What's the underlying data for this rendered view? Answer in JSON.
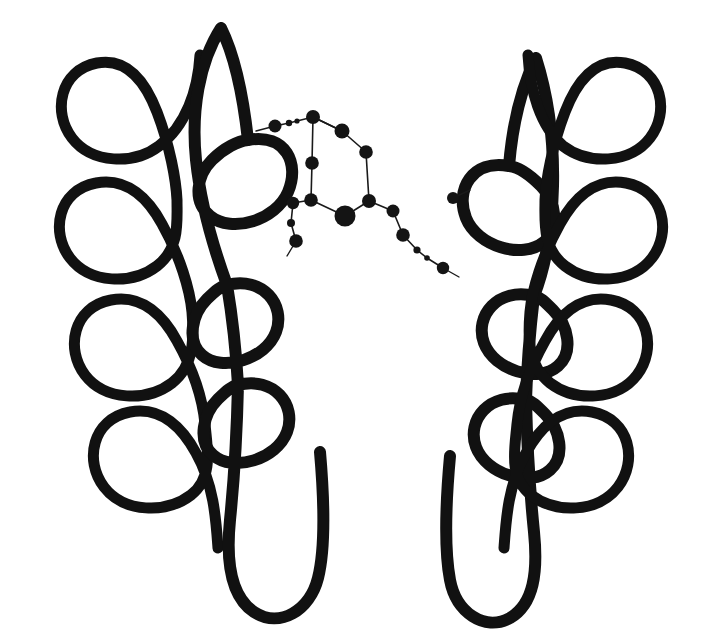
{
  "figure": {
    "kind": "protein-structure-cartoon",
    "background_color": "#ffffff",
    "ink_color": "#111111",
    "atom_color": "#141414",
    "bond_color": "#1a1a1a",
    "width": 720,
    "height": 634
  },
  "helices": [
    {
      "id": "helix-1",
      "label": "left-outer-helix",
      "coil_side": "left",
      "turns": 4,
      "stroke_width": 11,
      "tip": "tapered-top",
      "path": "M 97 63 C 60 70 52 112 72 138 C 92 164 134 165 159 146 C 186 126 198 90 200 55 M 97 63 C 129 57 147 86 157 112 C 170 146 176 180 177 200 M 96 183 C 58 190 50 232 70 258 C 90 284 132 285 157 266 C 180 248 177 222 177 200 M 96 183 C 128 177 149 200 162 224 C 180 256 190 290 192 312 M 111 300 C 73 307 65 349 85 375 C 105 401 147 402 172 383 C 195 365 194 336 192 312 M 111 300 C 143 294 164 317 177 341 C 195 373 203 403 205 424 M 130 412 C 92 419 84 461 104 487 C 124 513 166 514 191 495 C 214 477 207 448 205 424 M 130 412 C 162 406 183 429 196 453 C 214 485 216 520 218 548"
    },
    {
      "id": "helix-2",
      "label": "left-inner-helix",
      "coil_side": "right",
      "turns": 3,
      "stroke_width": 12,
      "tip": "tapered-top",
      "path": "M 221 28 C 199 62 191 112 196 160 C 201 208 215 252 227 285 M 221 28 C 236 58 244 104 248 140 M 248 140 C 286 133 300 164 288 192 C 276 220 232 234 210 216 C 192 201 197 175 212 160 C 224 148 238 141 248 140 M 227 285 C 263 276 286 305 276 332 C 266 359 222 373 202 355 C 186 341 192 314 207 299 C 216 290 221 286 227 285 M 227 285 C 232 315 236 350 238 385 M 238 385 C 274 376 297 405 287 432 C 277 459 233 473 213 455 C 197 441 203 414 218 399 C 227 390 232 386 238 385 M 238 385 C 237 430 234 480 230 520 C 226 560 230 596 254 612 C 280 629 310 610 318 578 C 326 546 324 498 320 452"
    },
    {
      "id": "helix-3",
      "label": "right-inner-helix",
      "coil_side": "left",
      "turns": 3,
      "stroke_width": 12,
      "tip": "arrow-top",
      "path": "M 536 58 C 548 96 554 142 553 186 C 552 230 545 268 534 296 M 536 58 C 520 90 512 130 509 166 M 509 166 C 472 159 455 190 466 218 C 477 246 522 260 544 242 C 560 228 556 201 541 186 C 529 174 519 167 509 166 M 534 296 C 498 287 474 316 484 343 C 494 370 538 384 558 366 C 574 352 568 325 553 310 C 544 301 540 297 534 296 M 534 296 C 530 330 527 365 526 400 M 526 400 C 490 391 466 420 476 447 C 486 474 530 488 550 470 C 566 456 560 429 545 414 C 536 405 532 401 526 400 M 526 400 C 527 445 530 492 534 532 C 538 572 534 604 510 618 C 484 632 456 612 450 580 C 444 548 446 500 450 456"
    },
    {
      "id": "helix-4",
      "label": "right-outer-helix",
      "coil_side": "right",
      "turns": 4,
      "stroke_width": 11,
      "tip": "tapered-top",
      "path": "M 625 63 C 662 70 670 112 650 138 C 630 164 588 165 563 146 C 540 126 530 90 528 55 M 625 63 C 593 57 575 86 565 112 C 552 146 546 180 545 200 M 626 183 C 664 190 672 232 652 258 C 632 284 590 285 565 266 C 542 248 545 222 545 200 M 626 183 C 594 177 573 200 560 224 C 542 256 532 290 530 312 M 611 300 C 649 307 657 349 637 375 C 617 401 575 402 550 383 C 527 365 528 336 530 312 M 611 300 C 579 294 558 317 545 341 C 527 373 519 403 517 424 M 592 412 C 630 419 638 461 618 487 C 598 513 556 514 531 495 C 508 477 515 448 517 424 M 592 412 C 560 406 539 429 526 453 C 508 485 506 520 504 548"
    }
  ],
  "ligand": {
    "id": "central-ligand",
    "label": "bound-ligand-ball-and-stick",
    "atom_count": 19,
    "bond_count": 19,
    "atoms": [
      {
        "id": "a1",
        "name": "atom-a1",
        "x": 275,
        "y": 126,
        "r": 6.5
      },
      {
        "id": "a2",
        "name": "atom-a2",
        "x": 289,
        "y": 123,
        "r": 3.2
      },
      {
        "id": "a3",
        "name": "atom-a3",
        "x": 297,
        "y": 121,
        "r": 2.6
      },
      {
        "id": "a4",
        "name": "atom-a4",
        "x": 313,
        "y": 117,
        "r": 7.0
      },
      {
        "id": "a5",
        "name": "atom-a5",
        "x": 342,
        "y": 131,
        "r": 7.5
      },
      {
        "id": "a6",
        "name": "atom-a6",
        "x": 366,
        "y": 152,
        "r": 6.8
      },
      {
        "id": "a7",
        "name": "atom-a7",
        "x": 312,
        "y": 163,
        "r": 6.8
      },
      {
        "id": "a8",
        "name": "atom-a8",
        "x": 311,
        "y": 200,
        "r": 6.8
      },
      {
        "id": "a9",
        "name": "atom-a9",
        "x": 369,
        "y": 201,
        "r": 7.0
      },
      {
        "id": "a10",
        "name": "atom-a10",
        "x": 345,
        "y": 216,
        "r": 10.5
      },
      {
        "id": "a11",
        "name": "atom-a11",
        "x": 293,
        "y": 203,
        "r": 6.2
      },
      {
        "id": "a12",
        "name": "atom-a12",
        "x": 291,
        "y": 223,
        "r": 4.0
      },
      {
        "id": "a13",
        "name": "atom-a13",
        "x": 296,
        "y": 241,
        "r": 6.8
      },
      {
        "id": "a14",
        "name": "atom-a14",
        "x": 393,
        "y": 211,
        "r": 6.5
      },
      {
        "id": "a15",
        "name": "atom-a15",
        "x": 403,
        "y": 235,
        "r": 6.8
      },
      {
        "id": "a16",
        "name": "atom-a16",
        "x": 417,
        "y": 250,
        "r": 3.6
      },
      {
        "id": "a17",
        "name": "atom-a17",
        "x": 427,
        "y": 258,
        "r": 2.8
      },
      {
        "id": "a18",
        "name": "atom-a18",
        "x": 443,
        "y": 268,
        "r": 6.2
      },
      {
        "id": "a19",
        "name": "atom-a19",
        "x": 453,
        "y": 198,
        "r": 6.0
      }
    ],
    "bonds": [
      {
        "from": "a1",
        "to": "a2"
      },
      {
        "from": "a2",
        "to": "a3"
      },
      {
        "from": "a3",
        "to": "a4"
      },
      {
        "from": "a4",
        "to": "a5"
      },
      {
        "from": "a5",
        "to": "a6"
      },
      {
        "from": "a4",
        "to": "a7"
      },
      {
        "from": "a7",
        "to": "a8"
      },
      {
        "from": "a6",
        "to": "a9"
      },
      {
        "from": "a8",
        "to": "a10"
      },
      {
        "from": "a9",
        "to": "a10"
      },
      {
        "from": "a8",
        "to": "a11"
      },
      {
        "from": "a11",
        "to": "a12"
      },
      {
        "from": "a12",
        "to": "a13"
      },
      {
        "from": "a9",
        "to": "a14"
      },
      {
        "from": "a14",
        "to": "a15"
      },
      {
        "from": "a15",
        "to": "a16"
      },
      {
        "from": "a16",
        "to": "a17"
      },
      {
        "from": "a17",
        "to": "a18"
      },
      {
        "from": "a5",
        "to": "a4"
      }
    ],
    "anchor_stubs": [
      {
        "id": "s1",
        "name": "ligand-anchor-left",
        "x1": 275,
        "y1": 126,
        "x2": 256,
        "y2": 131
      },
      {
        "id": "s2",
        "name": "ligand-anchor-a19",
        "x1": 453,
        "y1": 198,
        "x2": 470,
        "y2": 190
      },
      {
        "id": "s3",
        "name": "ligand-anchor-right",
        "x1": 443,
        "y1": 268,
        "x2": 459,
        "y2": 277
      },
      {
        "id": "s4",
        "name": "ligand-anchor-lower",
        "x1": 296,
        "y1": 241,
        "x2": 287,
        "y2": 256
      }
    ]
  }
}
